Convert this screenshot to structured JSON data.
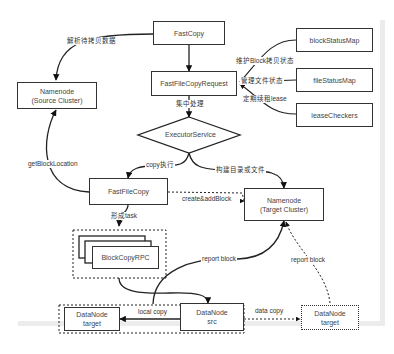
{
  "diagram": {
    "nodes": {
      "fastcopy": "FastCopy",
      "namenode_source": [
        "Namenode",
        "(Source Cluster)"
      ],
      "fastfilecopyrequest": "FastFileCopyRequest",
      "blockstatusmap": "blockStatusMap",
      "filestatusmap": "fileStatusMap",
      "leasecheckers": "leaseCheckers",
      "executorservice": "ExecutorService",
      "fastfilecopy": "FastFileCopy",
      "namenode_target": [
        "Namenode",
        "(Target Cluster)"
      ],
      "blockcopyrpc": "BlockCopyRPC",
      "datanode_target_local": [
        "DataNode",
        "target"
      ],
      "datanode_src": [
        "DataNode",
        "src"
      ],
      "datanode_target_remote": [
        "DataNode",
        "target"
      ]
    },
    "edges": {
      "parse_data": "解析待拷贝数据",
      "maintain_block_status": "维护Block拷贝状态",
      "manage_file_status": "管理文件状态",
      "renew_lease": "定期续租lease",
      "centralized_processing": "集中处理",
      "get_block_location": "getBlockLocation",
      "copy_execute": "copy执行",
      "build_dir_or_file": "构建目录或文件",
      "create_add_block": "create&addBlock",
      "form_task": "形成task",
      "report_block_1": "report block",
      "report_block_2": "report block",
      "local_copy": "local copy",
      "data_copy": "data copy"
    }
  }
}
